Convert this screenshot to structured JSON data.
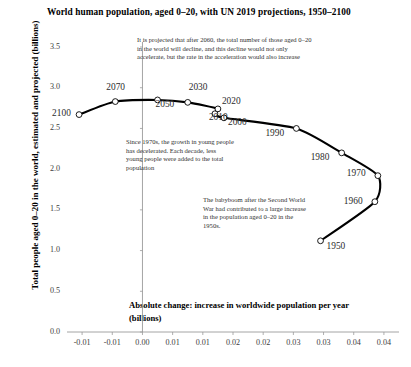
{
  "chart_data": {
    "type": "scatter",
    "title": "World human population, aged 0–20, with UN 2019 projections, 1950–2100",
    "xlabel": "Absolute change: increase in worldwide population per year (billions)",
    "ylabel": "Total people aged 0–20 in the world, estimated and projected (billions)",
    "xlim": [
      -0.0125,
      0.0425
    ],
    "ylim": [
      0.0,
      3.5
    ],
    "grid": false,
    "legend": "none",
    "xticklabels": [
      "-0.01",
      "-0.01",
      "0.00",
      "0.01",
      "0.01",
      "0.02",
      "0.02",
      "0.03",
      "0.03",
      "0.04",
      "0.04"
    ],
    "xtickvalues": [
      -0.01,
      -0.005,
      0.0,
      0.005,
      0.01,
      0.015,
      0.02,
      0.025,
      0.03,
      0.035,
      0.04
    ],
    "yticklabels": [
      "0.0",
      "0.5",
      "1.0",
      "1.5",
      "2.0",
      "2.5",
      "3.0",
      "3.5"
    ],
    "ytickvalues": [
      0.0,
      0.5,
      1.0,
      1.5,
      2.0,
      2.5,
      3.0,
      3.5
    ],
    "point_label_field": "year",
    "x_name": "absolute_change",
    "y_name": "population",
    "points": [
      {
        "year": "1950",
        "absolute_change": 0.0295,
        "population": 1.12
      },
      {
        "year": "1960",
        "absolute_change": 0.0385,
        "population": 1.6
      },
      {
        "year": "1970",
        "absolute_change": 0.039,
        "population": 1.92
      },
      {
        "year": "1980",
        "absolute_change": 0.033,
        "population": 2.2
      },
      {
        "year": "1990",
        "absolute_change": 0.0255,
        "population": 2.5
      },
      {
        "year": "2000",
        "absolute_change": 0.0135,
        "population": 2.63
      },
      {
        "year": "2010",
        "absolute_change": 0.012,
        "population": 2.68
      },
      {
        "year": "2020",
        "absolute_change": 0.0125,
        "population": 2.74
      },
      {
        "year": "2030",
        "absolute_change": 0.0075,
        "population": 2.82
      },
      {
        "year": "2050",
        "absolute_change": 0.0025,
        "population": 2.85
      },
      {
        "year": "2070",
        "absolute_change": -0.0045,
        "population": 2.83
      },
      {
        "year": "2100",
        "absolute_change": -0.0105,
        "population": 2.67
      }
    ],
    "annotations": [
      {
        "id": "projection-note",
        "text": "It is projected that after 2060, the total number of those aged 0–20 in the world will decline, and this decline would not only accelerate, but the rate in the acceleration would also increase"
      },
      {
        "id": "deceleration-note",
        "text": "Since 1970s, the growth in young people has decelerated. Each decade, less young people were added to the total population"
      },
      {
        "id": "babyboom-note",
        "text": "The babyboom after the Second World War had contributed to a large increase in the population aged 0–20 in the 1950s."
      }
    ],
    "colors": {
      "line": "#000000",
      "marker_fill": "#ffffff",
      "marker_edge": "#000000",
      "axis": "#9a9a9a",
      "text": "#1a1a1a"
    }
  }
}
